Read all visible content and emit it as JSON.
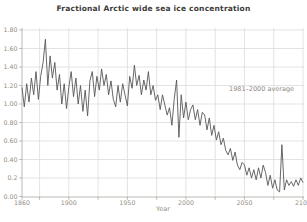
{
  "chart_data": {
    "type": "line",
    "title": "Fractional Arctic wide sea ice concentration",
    "xlabel": "Year",
    "ylabel": "",
    "annotation": "1981–2000 average",
    "legend": "none",
    "grid": "on (light gray, vertical every 25 years, horizontal every 0.2)",
    "xlim": [
      1860,
      2100
    ],
    "ylim": [
      0,
      1.8
    ],
    "x_gridlines_years": [
      1875,
      1900,
      1925,
      1950,
      1975,
      2000,
      2025,
      2050,
      2075,
      2100
    ],
    "y_gridlines_values": [
      0.2,
      0.4,
      0.6,
      0.8,
      1.0,
      1.2,
      1.4,
      1.6,
      1.8
    ],
    "x_ticks": [
      {
        "year": 1860,
        "label": "1860"
      },
      {
        "year": 1900,
        "label": "1900"
      },
      {
        "year": 1950,
        "label": "1950"
      },
      {
        "year": 2000,
        "label": "2000"
      },
      {
        "year": 2050,
        "label": "2050"
      },
      {
        "year": 2100,
        "label": "2100"
      }
    ],
    "x_minor_tick_years": [
      1860,
      1875,
      1900,
      1925,
      1950,
      1975,
      2000,
      2025,
      2050,
      2075,
      2100
    ],
    "y_ticks": [
      {
        "value": 1.8,
        "label": "1.80"
      },
      {
        "value": 1.6,
        "label": "1.60"
      },
      {
        "value": 1.4,
        "label": "1.40"
      },
      {
        "value": 1.2,
        "label": "1.20"
      },
      {
        "value": 1.0,
        "label": "1.00"
      },
      {
        "value": 0.8,
        "label": "0.80"
      },
      {
        "value": 0.6,
        "label": "0.60"
      },
      {
        "value": 0.4,
        "label": "0.40"
      },
      {
        "value": 0.2,
        "label": "0.2"
      },
      {
        "value": 0.0,
        "label": "0.00"
      }
    ],
    "series": [
      {
        "name": "fractional-sea-ice-concentration",
        "points": [
          [
            1860,
            1.18
          ],
          [
            1862,
            0.97
          ],
          [
            1864,
            1.22
          ],
          [
            1866,
            1.02
          ],
          [
            1868,
            1.28
          ],
          [
            1870,
            1.1
          ],
          [
            1872,
            1.35
          ],
          [
            1874,
            1.05
          ],
          [
            1876,
            1.3
          ],
          [
            1878,
            1.45
          ],
          [
            1880,
            1.7
          ],
          [
            1882,
            1.2
          ],
          [
            1884,
            1.52
          ],
          [
            1886,
            1.28
          ],
          [
            1888,
            1.45
          ],
          [
            1890,
            1.15
          ],
          [
            1892,
            1.32
          ],
          [
            1894,
            1.0
          ],
          [
            1896,
            1.22
          ],
          [
            1898,
            0.95
          ],
          [
            1900,
            1.18
          ],
          [
            1902,
            1.35
          ],
          [
            1904,
            1.08
          ],
          [
            1906,
            1.28
          ],
          [
            1908,
            1.0
          ],
          [
            1910,
            1.2
          ],
          [
            1912,
            0.92
          ],
          [
            1914,
            1.15
          ],
          [
            1916,
            0.87
          ],
          [
            1918,
            1.25
          ],
          [
            1920,
            1.35
          ],
          [
            1922,
            1.08
          ],
          [
            1924,
            1.3
          ],
          [
            1926,
            1.15
          ],
          [
            1928,
            1.38
          ],
          [
            1930,
            1.2
          ],
          [
            1932,
            1.32
          ],
          [
            1934,
            1.1
          ],
          [
            1936,
            1.25
          ],
          [
            1938,
            1.05
          ],
          [
            1940,
            0.97
          ],
          [
            1942,
            1.2
          ],
          [
            1944,
            1.02
          ],
          [
            1946,
            1.22
          ],
          [
            1948,
            1.1
          ],
          [
            1950,
            0.98
          ],
          [
            1952,
            1.3
          ],
          [
            1954,
            1.17
          ],
          [
            1956,
            1.42
          ],
          [
            1958,
            1.2
          ],
          [
            1960,
            1.31
          ],
          [
            1962,
            1.1
          ],
          [
            1964,
            1.26
          ],
          [
            1966,
            1.15
          ],
          [
            1968,
            1.35
          ],
          [
            1970,
            1.1
          ],
          [
            1972,
            1.2
          ],
          [
            1974,
            1.04
          ],
          [
            1976,
            1.1
          ],
          [
            1978,
            0.94
          ],
          [
            1980,
            1.1
          ],
          [
            1982,
            0.99
          ],
          [
            1984,
            0.88
          ],
          [
            1986,
            0.96
          ],
          [
            1988,
            0.77
          ],
          [
            1990,
            1.05
          ],
          [
            1992,
            1.26
          ],
          [
            1994,
            0.64
          ],
          [
            1996,
            1.1
          ],
          [
            1998,
            0.85
          ],
          [
            2000,
            1.02
          ],
          [
            2002,
            0.83
          ],
          [
            2004,
            0.94
          ],
          [
            2006,
            0.99
          ],
          [
            2008,
            0.83
          ],
          [
            2010,
            0.94
          ],
          [
            2012,
            0.77
          ],
          [
            2014,
            0.91
          ],
          [
            2016,
            0.88
          ],
          [
            2018,
            0.72
          ],
          [
            2020,
            0.85
          ],
          [
            2022,
            0.66
          ],
          [
            2024,
            0.77
          ],
          [
            2026,
            0.61
          ],
          [
            2028,
            0.7
          ],
          [
            2030,
            0.56
          ],
          [
            2032,
            0.63
          ],
          [
            2034,
            0.5
          ],
          [
            2036,
            0.45
          ],
          [
            2038,
            0.52
          ],
          [
            2040,
            0.39
          ],
          [
            2042,
            0.48
          ],
          [
            2044,
            0.34
          ],
          [
            2046,
            0.29
          ],
          [
            2048,
            0.37
          ],
          [
            2050,
            0.34
          ],
          [
            2052,
            0.23
          ],
          [
            2054,
            0.31
          ],
          [
            2056,
            0.2
          ],
          [
            2058,
            0.29
          ],
          [
            2060,
            0.18
          ],
          [
            2062,
            0.31
          ],
          [
            2064,
            0.2
          ],
          [
            2066,
            0.34
          ],
          [
            2068,
            0.26
          ],
          [
            2070,
            0.12
          ],
          [
            2072,
            0.23
          ],
          [
            2074,
            0.09
          ],
          [
            2076,
            0.18
          ],
          [
            2078,
            0.07
          ],
          [
            2080,
            0.05
          ],
          [
            2082,
            0.56
          ],
          [
            2084,
            0.07
          ],
          [
            2086,
            0.18
          ],
          [
            2088,
            0.12
          ],
          [
            2090,
            0.16
          ],
          [
            2092,
            0.11
          ],
          [
            2094,
            0.18
          ],
          [
            2096,
            0.12
          ],
          [
            2098,
            0.2
          ],
          [
            2100,
            0.15
          ]
        ]
      }
    ]
  },
  "colors": {
    "background": "#ffffff",
    "line": "#575757",
    "grid": "#dcdcdc",
    "spine": "#b5b0a8",
    "tick": "#b5b0a8",
    "tick_label": "#948e84",
    "title": "#3d3a37",
    "annotation": "#8f897f"
  }
}
